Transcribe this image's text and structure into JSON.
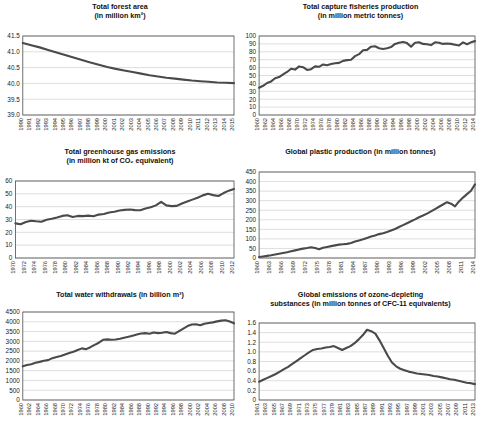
{
  "figure": {
    "panel_count": 6,
    "layout": "2 columns x 3 rows"
  },
  "chart_data": [
    {
      "id": "forest-area",
      "type": "line",
      "title": "Total forest area\n(in million km²)",
      "xlabel": "",
      "ylabel": "",
      "ylim": [
        39.0,
        41.5
      ],
      "yticks": [
        39.0,
        39.5,
        40.0,
        40.5,
        41.0,
        41.5
      ],
      "ytick_labels": [
        "39.0",
        "39.5",
        "40.0",
        "40.5",
        "41.0",
        "41.5"
      ],
      "grid": true,
      "legend": "none",
      "x": [
        1990,
        1991,
        1992,
        1993,
        1994,
        1995,
        1996,
        1997,
        1998,
        1999,
        2000,
        2001,
        2002,
        2003,
        2004,
        2005,
        2006,
        2007,
        2008,
        2009,
        2010,
        2011,
        2012,
        2013,
        2014,
        2015
      ],
      "xtick_labels": [
        "1990",
        "1991",
        "1992",
        "1993",
        "1994",
        "1995",
        "1996",
        "1997",
        "1998",
        "1999",
        "2000",
        "2001",
        "2002",
        "2003",
        "2004",
        "2005",
        "2006",
        "2007",
        "2008",
        "2009",
        "2010",
        "2011",
        "2012",
        "2013",
        "2014",
        "2015"
      ],
      "values": [
        41.28,
        41.21,
        41.14,
        41.06,
        40.98,
        40.9,
        40.82,
        40.74,
        40.66,
        40.59,
        40.52,
        40.46,
        40.41,
        40.36,
        40.31,
        40.26,
        40.22,
        40.18,
        40.15,
        40.12,
        40.09,
        40.07,
        40.05,
        40.03,
        40.02,
        40.01
      ]
    },
    {
      "id": "capture-fisheries",
      "type": "line",
      "title": "Total capture fisheries production\n(in million metric tonnes)",
      "xlabel": "",
      "ylabel": "",
      "ylim": [
        0,
        100
      ],
      "yticks": [
        0,
        10,
        20,
        30,
        40,
        50,
        60,
        70,
        80,
        90,
        100
      ],
      "ytick_labels": [
        "0",
        "10",
        "20",
        "30",
        "40",
        "50",
        "60",
        "70",
        "80",
        "90",
        "100"
      ],
      "grid": true,
      "legend": "none",
      "x": [
        1960,
        1961,
        1962,
        1963,
        1964,
        1965,
        1966,
        1967,
        1968,
        1969,
        1970,
        1971,
        1972,
        1973,
        1974,
        1975,
        1976,
        1977,
        1978,
        1979,
        1980,
        1981,
        1982,
        1983,
        1984,
        1985,
        1986,
        1987,
        1988,
        1989,
        1990,
        1991,
        1992,
        1993,
        1994,
        1995,
        1996,
        1997,
        1998,
        1999,
        2000,
        2001,
        2002,
        2003,
        2004,
        2005,
        2006,
        2007,
        2008,
        2009,
        2010,
        2011,
        2012,
        2013,
        2014
      ],
      "xtick_labels": [
        "1960",
        "1962",
        "1964",
        "1966",
        "1968",
        "1970",
        "1972",
        "1974",
        "1976",
        "1978",
        "1980",
        "1982",
        "1984",
        "1986",
        "1988",
        "1990",
        "1992",
        "1994",
        "1996",
        "1998",
        "2000",
        "2002",
        "2004",
        "2006",
        "2008",
        "2010",
        "2012",
        "2014"
      ],
      "values": [
        34.5,
        37.0,
        40.5,
        42.5,
        46.5,
        48.0,
        51.5,
        54.5,
        58.5,
        57.5,
        61.5,
        60.5,
        57.0,
        58.0,
        61.5,
        61.0,
        64.0,
        63.0,
        64.5,
        65.5,
        66.0,
        68.5,
        69.5,
        70.0,
        74.5,
        77.0,
        82.0,
        82.5,
        86.5,
        87.0,
        84.5,
        83.5,
        84.5,
        86.0,
        90.0,
        91.5,
        92.5,
        91.0,
        86.5,
        91.5,
        92.0,
        90.0,
        89.5,
        88.5,
        92.0,
        91.5,
        90.0,
        90.5,
        90.0,
        89.0,
        88.0,
        92.0,
        89.5,
        92.0,
        93.5
      ]
    },
    {
      "id": "greenhouse-gas",
      "type": "line",
      "title": "Total greenhouse gas emissions\n(in million kt of CO₂ equivalent)",
      "xlabel": "",
      "ylabel": "",
      "ylim": [
        0,
        60
      ],
      "yticks": [
        0,
        10,
        20,
        30,
        40,
        50,
        60
      ],
      "ytick_labels": [
        "0",
        "10",
        "20",
        "30",
        "40",
        "50",
        "60"
      ],
      "grid": true,
      "legend": "none",
      "x": [
        1970,
        1971,
        1972,
        1973,
        1974,
        1975,
        1976,
        1977,
        1978,
        1979,
        1980,
        1981,
        1982,
        1983,
        1984,
        1985,
        1986,
        1987,
        1988,
        1989,
        1990,
        1991,
        1992,
        1993,
        1994,
        1995,
        1996,
        1997,
        1998,
        1999,
        2000,
        2001,
        2002,
        2003,
        2004,
        2005,
        2006,
        2007,
        2008,
        2009,
        2010,
        2011,
        2012
      ],
      "xtick_labels": [
        "1970",
        "1972",
        "1974",
        "1976",
        "1978",
        "1980",
        "1982",
        "1984",
        "1986",
        "1988",
        "1990",
        "1992",
        "1994",
        "1996",
        "1998",
        "2000",
        "2002",
        "2004",
        "2006",
        "2008",
        "2010",
        "2012"
      ],
      "values": [
        27.0,
        26.3,
        28.0,
        29.0,
        28.6,
        28.3,
        29.8,
        30.6,
        31.5,
        32.8,
        33.3,
        32.0,
        32.8,
        32.6,
        33.0,
        32.5,
        33.8,
        34.3,
        35.5,
        36.0,
        37.0,
        37.5,
        37.8,
        37.3,
        37.2,
        38.5,
        39.5,
        41.0,
        43.8,
        41.0,
        40.4,
        40.6,
        42.5,
        44.0,
        45.5,
        47.0,
        48.8,
        50.0,
        49.0,
        48.3,
        50.6,
        52.5,
        53.8
      ]
    },
    {
      "id": "plastic-production",
      "type": "line",
      "title": "Global plastic production (in million tonnes)",
      "xlabel": "",
      "ylabel": "",
      "ylim": [
        0,
        450
      ],
      "yticks": [
        0,
        50,
        100,
        150,
        200,
        250,
        300,
        350,
        400,
        450
      ],
      "ytick_labels": [
        "0",
        "50",
        "100",
        "150",
        "200",
        "250",
        "300",
        "350",
        "400",
        "450"
      ],
      "grid": true,
      "legend": "none",
      "x": [
        1960,
        1961,
        1962,
        1963,
        1964,
        1965,
        1966,
        1967,
        1968,
        1969,
        1970,
        1971,
        1972,
        1973,
        1974,
        1975,
        1976,
        1977,
        1978,
        1979,
        1980,
        1981,
        1982,
        1983,
        1984,
        1985,
        1986,
        1987,
        1988,
        1989,
        1990,
        1991,
        1992,
        1993,
        1994,
        1995,
        1996,
        1997,
        1998,
        1999,
        2000,
        2001,
        2002,
        2003,
        2004,
        2005,
        2006,
        2007,
        2008,
        2009,
        2010,
        2011,
        2012,
        2013,
        2014
      ],
      "xtick_labels": [
        "1960",
        "1963",
        "1966",
        "1969",
        "1972",
        "1975",
        "1978",
        "1981",
        "1984",
        "1987",
        "1990",
        "1993",
        "1996",
        "1999",
        "2002",
        "2005",
        "2008",
        "2011",
        "2014"
      ],
      "values": [
        5,
        8,
        11,
        14,
        18,
        22,
        26,
        30,
        35,
        40,
        45,
        49,
        52,
        56,
        52,
        46,
        54,
        58,
        62,
        66,
        70,
        72,
        74,
        79,
        86,
        92,
        98,
        105,
        112,
        118,
        125,
        130,
        136,
        144,
        152,
        162,
        172,
        182,
        192,
        202,
        213,
        222,
        232,
        244,
        256,
        268,
        280,
        292,
        284,
        270,
        296,
        316,
        334,
        352,
        385
      ]
    },
    {
      "id": "water-withdrawals",
      "type": "line",
      "title": "Total water withdrawals (in billion m³)",
      "xlabel": "",
      "ylabel": "",
      "ylim": [
        0,
        4500
      ],
      "yticks": [
        0,
        500,
        1000,
        1500,
        2000,
        2500,
        3000,
        3500,
        4000,
        4500
      ],
      "ytick_labels": [
        "0",
        "500",
        "1000",
        "1500",
        "2000",
        "2500",
        "3000",
        "3500",
        "4000",
        "4500"
      ],
      "grid": true,
      "legend": "none",
      "x": [
        1960,
        1961,
        1962,
        1963,
        1964,
        1965,
        1966,
        1967,
        1968,
        1969,
        1970,
        1971,
        1972,
        1973,
        1974,
        1975,
        1976,
        1977,
        1978,
        1979,
        1980,
        1981,
        1982,
        1983,
        1984,
        1985,
        1986,
        1987,
        1988,
        1989,
        1990,
        1991,
        1992,
        1993,
        1994,
        1995,
        1996,
        1997,
        1998,
        1999,
        2000,
        2001,
        2002,
        2003,
        2004,
        2005,
        2006,
        2007,
        2008,
        2009,
        2010
      ],
      "xtick_labels": [
        "1960",
        "1962",
        "1964",
        "1966",
        "1968",
        "1970",
        "1972",
        "1974",
        "1976",
        "1978",
        "1980",
        "1982",
        "1984",
        "1986",
        "1988",
        "1990",
        "1992",
        "1994",
        "1996",
        "1998",
        "2000",
        "2002",
        "2004",
        "2006",
        "2008",
        "2010"
      ],
      "values": [
        1720,
        1790,
        1830,
        1900,
        1950,
        2010,
        2040,
        2140,
        2200,
        2250,
        2330,
        2400,
        2470,
        2560,
        2640,
        2600,
        2700,
        2820,
        2930,
        3080,
        3100,
        3080,
        3090,
        3130,
        3180,
        3230,
        3290,
        3350,
        3400,
        3420,
        3390,
        3450,
        3420,
        3440,
        3480,
        3420,
        3390,
        3520,
        3650,
        3780,
        3860,
        3870,
        3820,
        3900,
        3940,
        3970,
        4020,
        4060,
        4080,
        4010,
        3920
      ]
    },
    {
      "id": "ozone-depleting",
      "type": "line",
      "title": "Global emissions of ozone-depleting\nsubstances (in million tonnes of CFC-11 equivalents)",
      "xlabel": "",
      "ylabel": "",
      "ylim": [
        0,
        1.6
      ],
      "yticks": [
        0,
        0.2,
        0.4,
        0.6,
        0.8,
        1.0,
        1.2,
        1.4,
        1.6
      ],
      "ytick_labels": [
        "0",
        "0.2",
        "0.4",
        "0.6",
        "0.8",
        "1.0",
        "1.2",
        "1.4",
        "1.6"
      ],
      "grid": true,
      "legend": "none",
      "x": [
        1961,
        1962,
        1963,
        1964,
        1965,
        1966,
        1967,
        1968,
        1969,
        1970,
        1971,
        1972,
        1973,
        1974,
        1975,
        1976,
        1977,
        1978,
        1979,
        1980,
        1981,
        1982,
        1983,
        1984,
        1985,
        1986,
        1987,
        1988,
        1989,
        1990,
        1991,
        1992,
        1993,
        1994,
        1995,
        1996,
        1997,
        1998,
        1999,
        2000,
        2001,
        2002,
        2003,
        2004,
        2005,
        2006,
        2007,
        2008,
        2009,
        2010,
        2011,
        2012,
        2013
      ],
      "xtick_labels": [
        "1961",
        "1963",
        "1965",
        "1967",
        "1969",
        "1971",
        "1973",
        "1975",
        "1977",
        "1979",
        "1981",
        "1983",
        "1985",
        "1987",
        "1989",
        "1991",
        "1993",
        "1995",
        "1997",
        "1999",
        "2001",
        "2003",
        "2005",
        "2007",
        "2009",
        "2011",
        "2013"
      ],
      "values": [
        0.38,
        0.42,
        0.46,
        0.5,
        0.54,
        0.59,
        0.64,
        0.69,
        0.75,
        0.81,
        0.87,
        0.93,
        0.99,
        1.04,
        1.06,
        1.07,
        1.09,
        1.1,
        1.12,
        1.08,
        1.04,
        1.08,
        1.12,
        1.18,
        1.26,
        1.35,
        1.46,
        1.43,
        1.38,
        1.24,
        1.08,
        0.92,
        0.78,
        0.7,
        0.65,
        0.62,
        0.59,
        0.57,
        0.55,
        0.54,
        0.53,
        0.52,
        0.5,
        0.49,
        0.47,
        0.45,
        0.43,
        0.42,
        0.4,
        0.38,
        0.36,
        0.35,
        0.33
      ]
    }
  ]
}
